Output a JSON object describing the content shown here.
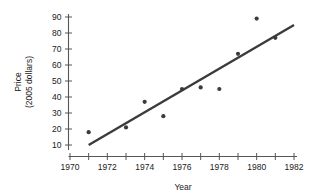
{
  "chart_data": {
    "type": "scatter",
    "title": "",
    "xlabel": "Year",
    "ylabel": "Price\n(2005 dollars)",
    "ylabel_line1": "Price",
    "ylabel_line2": "(2005 dollars)",
    "xlim": [
      1970,
      1982
    ],
    "ylim": [
      10,
      90
    ],
    "x_tick_step": 1,
    "x_label_step": 2,
    "y_tick_step": 10,
    "grid": false,
    "legend": null,
    "x_tick_labels": [
      "1970",
      "1972",
      "1974",
      "1976",
      "1978",
      "1980",
      "1982"
    ],
    "x_tick_label_values": [
      1970,
      1972,
      1974,
      1976,
      1978,
      1980,
      1982
    ],
    "x_tick_values": [
      1970,
      1971,
      1972,
      1973,
      1974,
      1975,
      1976,
      1977,
      1978,
      1979,
      1980,
      1981,
      1982
    ],
    "y_tick_labels": [
      "10",
      "20",
      "30",
      "40",
      "50",
      "60",
      "70",
      "80",
      "90"
    ],
    "y_tick_values": [
      10,
      20,
      30,
      40,
      50,
      60,
      70,
      80,
      90
    ],
    "x": [
      1971,
      1973,
      1974,
      1975,
      1976,
      1977,
      1978,
      1979,
      1980,
      1981
    ],
    "y": [
      18,
      21,
      37,
      28,
      45,
      46,
      45,
      67,
      89,
      77
    ],
    "points": [
      {
        "x": 1971,
        "y": 18
      },
      {
        "x": 1973,
        "y": 21
      },
      {
        "x": 1974,
        "y": 37
      },
      {
        "x": 1975,
        "y": 28
      },
      {
        "x": 1976,
        "y": 45
      },
      {
        "x": 1977,
        "y": 46
      },
      {
        "x": 1978,
        "y": 45
      },
      {
        "x": 1979,
        "y": 67
      },
      {
        "x": 1980,
        "y": 89
      },
      {
        "x": 1981,
        "y": 77
      }
    ],
    "trend_line": {
      "type": "linear-fit",
      "x_start": 1971,
      "y_start": 10,
      "x_end": 1982,
      "y_end": 85
    },
    "colors": {
      "point": "#3b3b3b",
      "trend_line": "#3b3b3b",
      "axis": "#555555",
      "text": "#1a1a1a",
      "background": "#ffffff"
    }
  }
}
